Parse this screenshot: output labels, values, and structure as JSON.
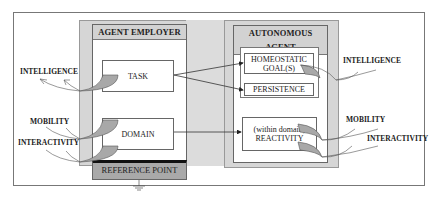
{
  "diagram": {
    "employer": {
      "title": "AGENT EMPLOYER",
      "task": "TASK",
      "domain": "DOMAIN",
      "reference_point": "REFERENCE POINT"
    },
    "agent": {
      "title": "AUTONOMOUS AGENT",
      "homeostatic_line1": "HOMEOSTATIC",
      "homeostatic_line2": "GOAL(S)",
      "persistence": "PERSISTENCE",
      "reactivity_line1": "(within domain)",
      "reactivity_line2": "REACTIVITY"
    },
    "left_labels": {
      "intelligence": "INTELLIGENCE",
      "mobility": "MOBILITY",
      "interactivity": "INTERACTIVITY"
    },
    "right_labels": {
      "intelligence": "INTELLIGENCE",
      "mobility": "MOBILITY",
      "interactivity": "INTERACTIVITY"
    },
    "colors": {
      "panel_grey": "#d6d6d6",
      "header_grey": "#d2d2d2",
      "reference_grey": "#a9a9a9",
      "flow_fill": "#a8a8a8"
    }
  }
}
